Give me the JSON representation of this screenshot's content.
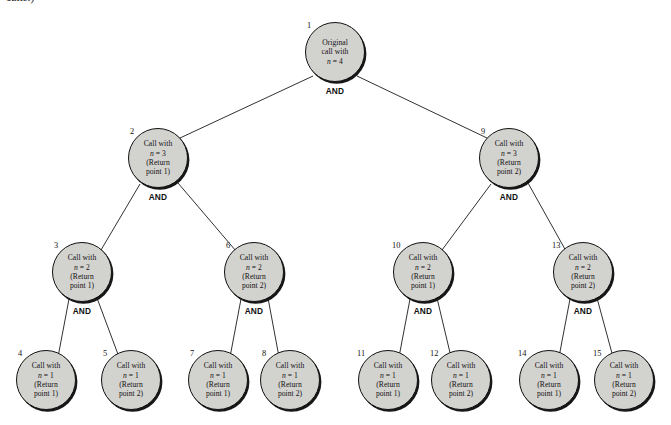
{
  "figure": {
    "caption_fragment": "calls.)",
    "and_label": "AND",
    "node_fill_color": "#d2d2cf",
    "node_border_color": "#111111",
    "background_color": "#ffffff"
  },
  "nodes": [
    {
      "id": "1",
      "number": "1",
      "line1": "Original",
      "line2": "call with",
      "line3": "n = 4",
      "line4": "",
      "cx": 335,
      "cy": 52,
      "num_x": 307,
      "num_y": 21,
      "has_and": true,
      "and_x": 335,
      "and_y": 91
    },
    {
      "id": "2",
      "number": "2",
      "line1": "Call with",
      "line2": "n = 3",
      "line3": "(Return",
      "line4": "point 1)",
      "cx": 158,
      "cy": 158,
      "num_x": 130,
      "num_y": 127,
      "has_and": true,
      "and_x": 158,
      "and_y": 197
    },
    {
      "id": "9",
      "number": "9",
      "line1": "Call with",
      "line2": "n = 3",
      "line3": "(Return",
      "line4": "point 2)",
      "cx": 509,
      "cy": 158,
      "num_x": 481,
      "num_y": 127,
      "has_and": true,
      "and_x": 509,
      "and_y": 197
    },
    {
      "id": "3",
      "number": "3",
      "line1": "Call with",
      "line2": "n = 2",
      "line3": "(Return",
      "line4": "point 1)",
      "cx": 82,
      "cy": 272,
      "num_x": 54,
      "num_y": 241,
      "has_and": true,
      "and_x": 82,
      "and_y": 311
    },
    {
      "id": "6",
      "number": "6",
      "line1": "Call with",
      "line2": "n = 2",
      "line3": "(Return",
      "line4": "point 2)",
      "cx": 254,
      "cy": 272,
      "num_x": 226,
      "num_y": 241,
      "has_and": true,
      "and_x": 254,
      "and_y": 311
    },
    {
      "id": "10",
      "number": "10",
      "line1": "Call with",
      "line2": "n = 2",
      "line3": "(Return",
      "line4": "point 1)",
      "cx": 423,
      "cy": 272,
      "num_x": 392,
      "num_y": 241,
      "has_and": true,
      "and_x": 423,
      "and_y": 311
    },
    {
      "id": "13",
      "number": "13",
      "line1": "Call with",
      "line2": "n = 2",
      "line3": "(Return",
      "line4": "point 2)",
      "cx": 583,
      "cy": 272,
      "num_x": 552,
      "num_y": 241,
      "has_and": true,
      "and_x": 583,
      "and_y": 311
    },
    {
      "id": "4",
      "number": "4",
      "line1": "Call with",
      "line2": "n = 1",
      "line3": "(Return",
      "line4": "point 1)",
      "cx": 46,
      "cy": 380,
      "num_x": 18,
      "num_y": 349,
      "has_and": false,
      "and_x": 0,
      "and_y": 0
    },
    {
      "id": "5",
      "number": "5",
      "line1": "Call with",
      "line2": "n = 1",
      "line3": "(Return",
      "line4": "point 2)",
      "cx": 131,
      "cy": 380,
      "num_x": 103,
      "num_y": 349,
      "has_and": false,
      "and_x": 0,
      "and_y": 0
    },
    {
      "id": "7",
      "number": "7",
      "line1": "Call with",
      "line2": "n = 1",
      "line3": "(Return",
      "line4": "point 1)",
      "cx": 218,
      "cy": 380,
      "num_x": 190,
      "num_y": 349,
      "has_and": false,
      "and_x": 0,
      "and_y": 0
    },
    {
      "id": "8",
      "number": "8",
      "line1": "Call with",
      "line2": "n = 1",
      "line3": "(Return",
      "line4": "point 2)",
      "cx": 290,
      "cy": 380,
      "num_x": 262,
      "num_y": 349,
      "has_and": false,
      "and_x": 0,
      "and_y": 0
    },
    {
      "id": "11",
      "number": "11",
      "line1": "Call with",
      "line2": "n = 1",
      "line3": "(Return",
      "line4": "point 1)",
      "cx": 388,
      "cy": 380,
      "num_x": 357,
      "num_y": 349,
      "has_and": false,
      "and_x": 0,
      "and_y": 0
    },
    {
      "id": "12",
      "number": "12",
      "line1": "Call with",
      "line2": "n = 1",
      "line3": "(Return",
      "line4": "point 2)",
      "cx": 461,
      "cy": 380,
      "num_x": 430,
      "num_y": 349,
      "has_and": false,
      "and_x": 0,
      "and_y": 0
    },
    {
      "id": "14",
      "number": "14",
      "line1": "Call with",
      "line2": "n = 1",
      "line3": "(Return",
      "line4": "point 1)",
      "cx": 549,
      "cy": 380,
      "num_x": 518,
      "num_y": 349,
      "has_and": false,
      "and_x": 0,
      "and_y": 0
    },
    {
      "id": "15",
      "number": "15",
      "line1": "Call with",
      "line2": "n = 1",
      "line3": "(Return",
      "line4": "point 2)",
      "cx": 624,
      "cy": 380,
      "num_x": 593,
      "num_y": 349,
      "has_and": false,
      "and_x": 0,
      "and_y": 0
    }
  ],
  "edges": [
    {
      "from": "1",
      "to": "2",
      "x1": 313,
      "y1": 76,
      "x2": 180,
      "y2": 138
    },
    {
      "from": "1",
      "to": "9",
      "x1": 357,
      "y1": 76,
      "x2": 487,
      "y2": 138
    },
    {
      "from": "2",
      "to": "3",
      "x1": 140,
      "y1": 184,
      "x2": 101,
      "y2": 250
    },
    {
      "from": "2",
      "to": "6",
      "x1": 178,
      "y1": 183,
      "x2": 236,
      "y2": 251
    },
    {
      "from": "9",
      "to": "10",
      "x1": 491,
      "y1": 184,
      "x2": 442,
      "y2": 250
    },
    {
      "from": "9",
      "to": "13",
      "x1": 528,
      "y1": 183,
      "x2": 566,
      "y2": 251
    },
    {
      "from": "3",
      "to": "4",
      "x1": 69,
      "y1": 299,
      "x2": 58,
      "y2": 357
    },
    {
      "from": "3",
      "to": "5",
      "x1": 97,
      "y1": 298,
      "x2": 119,
      "y2": 357
    },
    {
      "from": "6",
      "to": "7",
      "x1": 241,
      "y1": 299,
      "x2": 230,
      "y2": 357
    },
    {
      "from": "6",
      "to": "8",
      "x1": 268,
      "y1": 298,
      "x2": 279,
      "y2": 357
    },
    {
      "from": "10",
      "to": "11",
      "x1": 410,
      "y1": 299,
      "x2": 399,
      "y2": 357
    },
    {
      "from": "10",
      "to": "12",
      "x1": 437,
      "y1": 298,
      "x2": 451,
      "y2": 357
    },
    {
      "from": "13",
      "to": "14",
      "x1": 570,
      "y1": 299,
      "x2": 559,
      "y2": 357
    },
    {
      "from": "13",
      "to": "15",
      "x1": 597,
      "y1": 298,
      "x2": 613,
      "y2": 357
    }
  ]
}
